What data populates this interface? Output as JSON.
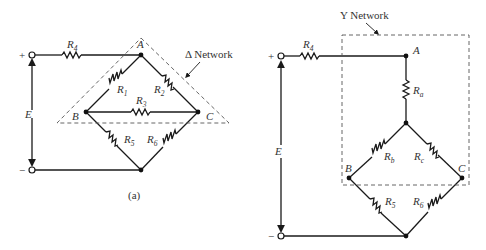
{
  "figure_a": {
    "network_label": "Δ Network",
    "caption": "(a)",
    "source": {
      "label": "E",
      "plus": "+",
      "minus": "−"
    },
    "nodes": {
      "A": "A",
      "B": "B",
      "C": "C"
    },
    "resistors": [
      {
        "id": "R4",
        "base": "R",
        "sub": "4"
      },
      {
        "id": "R1",
        "base": "R",
        "sub": "1"
      },
      {
        "id": "R2",
        "base": "R",
        "sub": "2"
      },
      {
        "id": "R3",
        "base": "R",
        "sub": "3"
      },
      {
        "id": "R5",
        "base": "R",
        "sub": "5"
      },
      {
        "id": "R6",
        "base": "R",
        "sub": "6"
      }
    ]
  },
  "figure_b": {
    "network_label": "Y Network",
    "source": {
      "label": "E",
      "plus": "+",
      "minus": "−"
    },
    "nodes": {
      "A": "A",
      "B": "B",
      "C": "C"
    },
    "resistors": [
      {
        "id": "R4",
        "base": "R",
        "sub": "4"
      },
      {
        "id": "Ra",
        "base": "R",
        "sub": "a"
      },
      {
        "id": "Rb",
        "base": "R",
        "sub": "b"
      },
      {
        "id": "Rc",
        "base": "R",
        "sub": "c"
      },
      {
        "id": "R5",
        "base": "R",
        "sub": "5"
      },
      {
        "id": "R6",
        "base": "R",
        "sub": "6"
      }
    ]
  }
}
